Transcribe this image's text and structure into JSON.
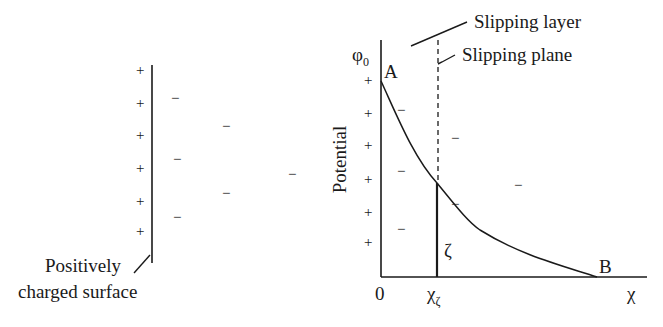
{
  "left_panel": {
    "surface_label_line1": "Positively",
    "surface_label_line2": "charged surface",
    "plus_signs": [
      "+",
      "+",
      "+",
      "+",
      "+",
      "+"
    ],
    "minus_signs": [
      "−",
      "−",
      "−",
      "−",
      "−",
      "−"
    ]
  },
  "right_panel": {
    "y_axis_label": "Potential",
    "y_axis_top_label": "φ",
    "y_axis_top_subscript": "0",
    "point_a": "A",
    "point_b": "B",
    "origin": "0",
    "x_zeta": "χ",
    "x_zeta_subscript": "ζ",
    "x_axis_label": "χ",
    "zeta_label": "ζ",
    "slipping_layer": "Slipping layer",
    "slipping_plane": "Slipping plane",
    "plus_signs": [
      "+",
      "+",
      "+",
      "+",
      "+",
      "+"
    ],
    "minus_signs": [
      "−",
      "−",
      "−",
      "−",
      "−",
      "−",
      "−"
    ]
  }
}
